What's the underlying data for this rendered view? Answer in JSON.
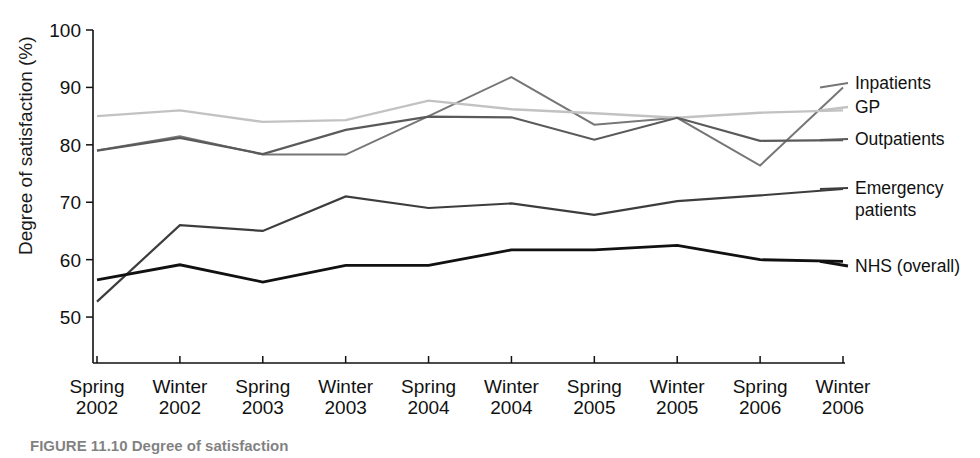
{
  "chart_data": {
    "type": "line",
    "title": "",
    "xlabel": "",
    "ylabel": "Degree of satisfaction (%)",
    "ylim": [
      42,
      100
    ],
    "yticks": [
      50,
      60,
      70,
      80,
      90,
      100
    ],
    "grid": false,
    "legend_position": "right-inline",
    "categories": [
      "Spring 2002",
      "Winter 2002",
      "Spring 2003",
      "Winter 2003",
      "Spring 2004",
      "Winter 2004",
      "Spring 2005",
      "Winter 2005",
      "Spring 2006",
      "Winter 2006"
    ],
    "category_lines": [
      [
        "Spring",
        "2002"
      ],
      [
        "Winter",
        "2002"
      ],
      [
        "Spring",
        "2003"
      ],
      [
        "Winter",
        "2003"
      ],
      [
        "Spring",
        "2004"
      ],
      [
        "Winter",
        "2004"
      ],
      [
        "Spring",
        "2005"
      ],
      [
        "Winter",
        "2005"
      ],
      [
        "Spring",
        "2006"
      ],
      [
        "Winter",
        "2006"
      ]
    ],
    "series": [
      {
        "name": "Inpatients",
        "color": "#767676",
        "width": 2.0,
        "values": [
          79.0,
          81.5,
          78.3,
          78.3,
          85.0,
          91.8,
          83.5,
          84.7,
          76.4,
          90.0
        ]
      },
      {
        "name": "GP",
        "color": "#c2c2c2",
        "width": 2.4,
        "values": [
          85.0,
          86.0,
          84.0,
          84.3,
          87.7,
          86.2,
          85.5,
          84.7,
          85.6,
          86.0
        ]
      },
      {
        "name": "Outpatients",
        "color": "#5a5a5a",
        "width": 2.2,
        "values": [
          79.0,
          81.2,
          78.4,
          82.6,
          84.9,
          84.8,
          80.9,
          84.7,
          80.7,
          80.8
        ]
      },
      {
        "name": "Emergency patients",
        "color": "#3d3d3d",
        "width": 2.2,
        "values": [
          52.7,
          66.0,
          65.0,
          71.0,
          69.0,
          69.8,
          67.8,
          70.2,
          71.2,
          72.3
        ]
      },
      {
        "name": "NHS (overall)",
        "color": "#111111",
        "width": 2.8,
        "values": [
          56.5,
          59.1,
          56.1,
          59.0,
          59.0,
          61.7,
          61.7,
          62.5,
          60.0,
          59.7
        ]
      }
    ],
    "legend_entries": [
      {
        "label": "Inpatients",
        "color": "#767676"
      },
      {
        "label": "GP",
        "color": "#c2c2c2"
      },
      {
        "label": "Outpatients",
        "color": "#5a5a5a"
      },
      {
        "label": "Emergency",
        "label2": "patients",
        "color": "#3d3d3d"
      },
      {
        "label": "NHS (overall)",
        "color": "#111111"
      }
    ]
  },
  "axis": {
    "y_title": "Degree of satisfaction (%)",
    "ytick_labels": [
      "50",
      "60",
      "70",
      "80",
      "90",
      "100"
    ],
    "xtick_top": [
      "Spring",
      "Winter",
      "Spring",
      "Winter",
      "Spring",
      "Winter",
      "Spring",
      "Winter",
      "Spring",
      "Winter"
    ],
    "xtick_bottom": [
      "2002",
      "2002",
      "2003",
      "2003",
      "2004",
      "2004",
      "2005",
      "2005",
      "2006",
      "2006"
    ]
  },
  "legend": {
    "inpatients": "Inpatients",
    "gp": "GP",
    "outpatients": "Outpatients",
    "emergency_line1": "Emergency",
    "emergency_line2": "patients",
    "nhs": "NHS (overall)"
  },
  "caption": {
    "text": "FIGURE 11.10  Degree of satisfaction"
  },
  "colors": {
    "inpatients": "#767676",
    "gp": "#c2c2c2",
    "outpatients": "#5a5a5a",
    "emergency": "#3d3d3d",
    "nhs": "#111111",
    "axis": "#111111",
    "background": "#ffffff"
  }
}
